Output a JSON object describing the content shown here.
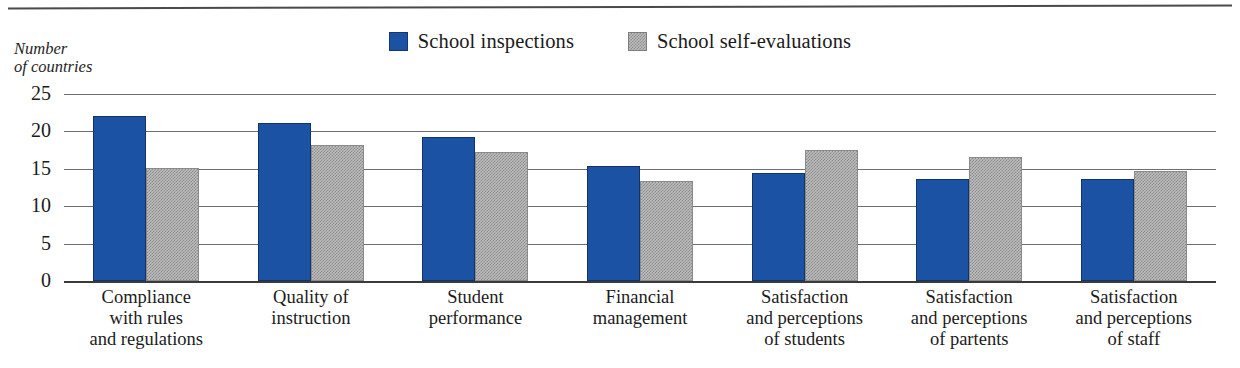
{
  "chart_data": {
    "type": "bar",
    "title": "",
    "xlabel": "",
    "ylabel": "Number of countries",
    "ylim": [
      0,
      25
    ],
    "yticks": [
      0,
      5,
      10,
      15,
      20,
      25
    ],
    "grid": true,
    "legend_position": "top-center",
    "categories": [
      "Compliance with rules and regulations",
      "Quality of instruction",
      "Student performance",
      "Financial management",
      "Satisfaction and perceptions of students",
      "Satisfaction and perceptions of partents",
      "Satisfaction and perceptions of staff"
    ],
    "category_lines": [
      [
        "Compliance",
        "with rules",
        "and regulations"
      ],
      [
        "Quality of",
        "instruction"
      ],
      [
        "Student",
        "performance"
      ],
      [
        "Financial",
        "management"
      ],
      [
        "Satisfaction",
        "and perceptions",
        "of students"
      ],
      [
        "Satisfaction",
        "and perceptions",
        "of partents"
      ],
      [
        "Satisfaction",
        "and perceptions",
        "of staff"
      ]
    ],
    "series": [
      {
        "name": "School inspections",
        "color": "#1b52a4",
        "values": [
          22.1,
          21.1,
          19.3,
          15.4,
          14.5,
          13.6,
          13.7
        ]
      },
      {
        "name": "School self-evaluations",
        "color": "#bdbdbd",
        "values": [
          15.1,
          18.2,
          17.3,
          13.4,
          17.5,
          16.6,
          14.7
        ]
      }
    ]
  },
  "axis_caption": {
    "line1": "Number",
    "line2": "of countries"
  },
  "legend": {
    "items": [
      {
        "label": "School inspections",
        "swatch": "blue"
      },
      {
        "label": "School self-evaluations",
        "swatch": "gray"
      }
    ]
  },
  "yticks": {
    "t0": "25",
    "t1": "20",
    "t2": "15",
    "t3": "10",
    "t4": "5",
    "t5": "0"
  }
}
